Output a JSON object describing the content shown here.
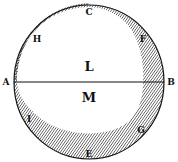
{
  "figure": {
    "colors": {
      "ink": "#111111",
      "paper": "#ffffff"
    },
    "labels": {
      "A": "A",
      "B": "B",
      "C": "C",
      "E": "E",
      "F": "F",
      "G": "G",
      "H": "H",
      "I": "I",
      "L": "L",
      "M": "M"
    }
  }
}
